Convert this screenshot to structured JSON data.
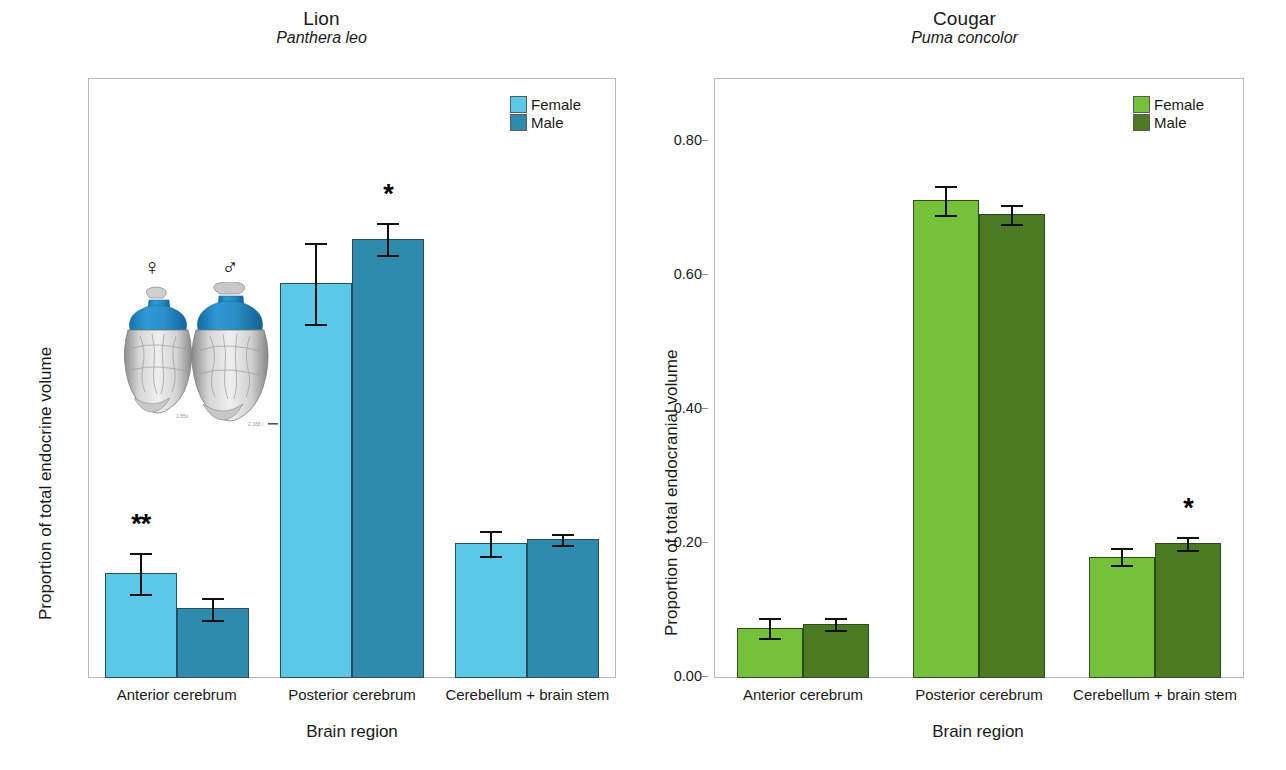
{
  "figure": {
    "width": 1286,
    "height": 770
  },
  "panels": [
    {
      "id": "lion",
      "title_common": "Lion",
      "title_latin": "Panthera leo",
      "ylabel": "Proportion of total endocrine volume",
      "xlabel": "Brain region",
      "yticks": [
        "0.00",
        "0.20",
        "0.40",
        "0.60"
      ],
      "colors": {
        "female": "#5BC8E8",
        "male": "#2E8BAE",
        "edge": "#2a4d5c"
      },
      "legend": [
        {
          "label": "Female",
          "color": "#5BC8E8"
        },
        {
          "label": "Male",
          "color": "#2E8BAE"
        }
      ],
      "inset": {
        "female_symbol": "♀",
        "male_symbol": "♂",
        "female_scale_text": "1.85x",
        "male_scale_text": "2.188 /"
      }
    },
    {
      "id": "cougar",
      "title_common": "Cougar",
      "title_latin": "Puma concolor",
      "ylabel": "Proportion of total endocranial volume",
      "xlabel": "Brain region",
      "yticks": [
        "0.00",
        "0.20",
        "0.40",
        "0.60",
        "0.80"
      ],
      "colors": {
        "female": "#76C13A",
        "male": "#4C7A23",
        "edge": "#2f4a1c"
      },
      "legend": [
        {
          "label": "Female",
          "color": "#76C13A"
        },
        {
          "label": "Male",
          "color": "#4C7A23"
        }
      ]
    }
  ],
  "chart_data": [
    {
      "type": "bar",
      "title": "Lion (Panthera leo)",
      "xlabel": "Brain region",
      "ylabel": "Proportion of total endocrine volume",
      "categories": [
        "Anterior cerebrum",
        "Posterior cerebrum",
        "Cerebellum + brain stem"
      ],
      "ylim": [
        0.0,
        0.72
      ],
      "yticks": [
        0.0,
        0.2,
        0.4,
        0.6
      ],
      "grid": false,
      "legend_position": "top-right",
      "series": [
        {
          "name": "Female",
          "color": "#5BC8E8",
          "values": [
            0.156,
            0.589,
            0.202
          ],
          "err_low": [
            0.03,
            0.06,
            0.02
          ],
          "err_high": [
            0.03,
            0.06,
            0.017
          ]
        },
        {
          "name": "Male",
          "color": "#2E8BAE",
          "values": [
            0.105,
            0.655,
            0.207
          ],
          "err_low": [
            0.019,
            0.024,
            0.008
          ],
          "err_high": [
            0.015,
            0.024,
            0.008
          ]
        }
      ],
      "annotations": [
        {
          "text": "**",
          "category": "Anterior cerebrum",
          "series": "Female"
        },
        {
          "text": "*",
          "category": "Posterior cerebrum",
          "series": "Male"
        }
      ]
    },
    {
      "type": "bar",
      "title": "Cougar (Puma concolor)",
      "xlabel": "Brain region",
      "ylabel": "Proportion of total endocranial volume",
      "categories": [
        "Anterior cerebrum",
        "Posterior cerebrum",
        "Cerebellum + brain stem"
      ],
      "ylim": [
        0.0,
        0.88
      ],
      "yticks": [
        0.0,
        0.2,
        0.4,
        0.6,
        0.8
      ],
      "grid": false,
      "legend_position": "top-right",
      "series": [
        {
          "name": "Female",
          "color": "#76C13A",
          "values": [
            0.074,
            0.713,
            0.181
          ],
          "err_low": [
            0.015,
            0.022,
            0.013
          ],
          "err_high": [
            0.015,
            0.022,
            0.013
          ]
        },
        {
          "name": "Male",
          "color": "#4C7A23",
          "values": [
            0.08,
            0.692,
            0.201
          ],
          "err_low": [
            0.009,
            0.014,
            0.01
          ],
          "err_high": [
            0.009,
            0.014,
            0.01
          ]
        }
      ],
      "annotations": [
        {
          "text": "*",
          "category": "Cerebellum + brain stem",
          "series": "Male"
        }
      ]
    }
  ]
}
